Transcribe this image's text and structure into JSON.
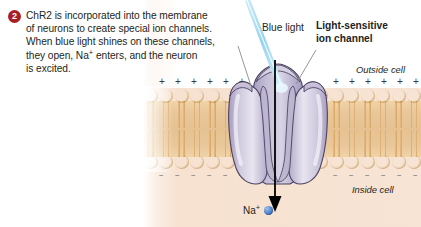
{
  "step": {
    "number": "2",
    "badge_color": "#a81f28",
    "caption_line1": "ChR2 is incorporated into the membrane",
    "caption_line2": "of neurons to create special ion channels.",
    "caption_line3": "When blue light shines on these channels,",
    "caption_line4_a": "they open, Na",
    "caption_line4_sup": "+",
    "caption_line4_b": " enters, and the neuron",
    "caption_line5": "is excited."
  },
  "labels": {
    "blue_light": "Blue light",
    "ion_channel_line1": "Light-sensitive",
    "ion_channel_line2": "ion channel",
    "outside_cell": "Outside cell",
    "inside_cell": "Inside cell",
    "sodium_ion": "Na",
    "sodium_charge": "+"
  },
  "membrane": {
    "charge_outside": "+",
    "charge_inside": "−",
    "charge_outside_count": 12,
    "charge_inside_count": 12,
    "lipid_count": 18,
    "head_color": "#f0ce52",
    "tail_color": "#dfae6f",
    "interior_color": "#e6c292"
  },
  "colors": {
    "channel_fill": "#b9b2ce",
    "channel_light": "#e2dfec",
    "channel_outline": "#4b4260",
    "light_beam": "#8fd0ee",
    "cell_panel": "#f8e4d4",
    "ion_blue": "#2f5fae",
    "arrow": "#000000"
  }
}
